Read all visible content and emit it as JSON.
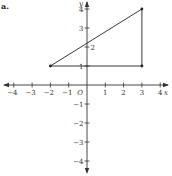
{
  "part_label": "a.",
  "chart_data": {
    "type": "line",
    "title": "",
    "xlabel": "x",
    "ylabel": "y",
    "origin_label": "O",
    "xlim": [
      -4,
      4
    ],
    "ylim": [
      -4,
      4
    ],
    "x_ticks": [
      -4,
      -3,
      -2,
      -1,
      1,
      2,
      3,
      4
    ],
    "y_ticks": [
      -4,
      -3,
      -2,
      -1,
      1,
      2,
      3,
      4
    ],
    "grid": false,
    "series": [
      {
        "name": "triangle",
        "closed": true,
        "points": [
          {
            "x": -2,
            "y": 1
          },
          {
            "x": 3,
            "y": 1
          },
          {
            "x": 3,
            "y": 4
          }
        ]
      }
    ]
  }
}
